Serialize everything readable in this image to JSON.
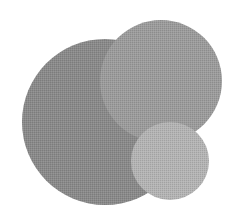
{
  "illustration": {
    "background": "#ffffff",
    "circles": [
      {
        "name": "large-circle",
        "cx": 105,
        "cy": 122,
        "r": 83,
        "color": "#8a8a8a"
      },
      {
        "name": "medium-circle",
        "cx": 161,
        "cy": 81,
        "r": 61,
        "color": "#9c9c9c"
      },
      {
        "name": "small-circle",
        "cx": 170,
        "cy": 161,
        "r": 39,
        "color": "#b4b4b4"
      }
    ]
  }
}
